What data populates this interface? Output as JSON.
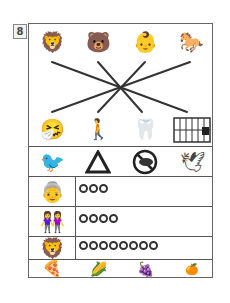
{
  "question_number": "8",
  "top_row": {
    "pictures": [
      {
        "name": "lion",
        "glyph": "🦁"
      },
      {
        "name": "bear",
        "glyph": "🐻"
      },
      {
        "name": "baby",
        "glyph": "👶"
      },
      {
        "name": "horse",
        "glyph": "🐎"
      }
    ]
  },
  "bottom_row": {
    "pictures": [
      {
        "name": "coughing-person",
        "glyph": "🤧"
      },
      {
        "name": "person-with-back-pain",
        "glyph": "🚶"
      },
      {
        "name": "toothache",
        "glyph": "🦷"
      },
      {
        "name": "jail-cage",
        "glyph": ""
      }
    ]
  },
  "connecting_lines": [
    {
      "from": "lion",
      "to": "jail-cage"
    },
    {
      "from": "bear",
      "to": "toothache"
    },
    {
      "from": "baby",
      "to": "person-with-back-pain"
    },
    {
      "from": "horse",
      "to": "coughing-person"
    }
  ],
  "bird_row": {
    "pictures": [
      {
        "name": "sparrow",
        "glyph": "🐦"
      },
      {
        "name": "warning-triangle-bird",
        "glyph": "⚠"
      },
      {
        "name": "crossed-out-crow",
        "glyph": "🚫"
      },
      {
        "name": "pigeon",
        "glyph": "🕊"
      }
    ]
  },
  "count_table": {
    "rows": [
      {
        "picture": "grandmother",
        "glyph": "👵",
        "count": 3
      },
      {
        "picture": "two-girls",
        "glyph": "👭",
        "count": 4
      },
      {
        "picture": "lion-face",
        "glyph": "🦁",
        "count": 8
      }
    ]
  },
  "food_row": {
    "pictures": [
      {
        "name": "pizza",
        "glyph": "🍕"
      },
      {
        "name": "corn",
        "glyph": "🌽"
      },
      {
        "name": "grapes",
        "glyph": "🍇"
      },
      {
        "name": "orange",
        "glyph": "🍊"
      }
    ]
  },
  "colors": {
    "line": "#333333",
    "border": "#555555"
  }
}
